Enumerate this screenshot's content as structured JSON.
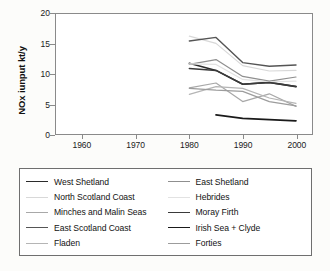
{
  "chart_data": {
    "type": "line",
    "title": "",
    "xlabel": "",
    "ylabel": "NOx iunput kt/y",
    "xlim": [
      1955,
      2003
    ],
    "ylim": [
      0,
      20
    ],
    "xticks": [
      1960,
      1970,
      1980,
      1990,
      2000
    ],
    "yticks": [
      0,
      5,
      10,
      15,
      20
    ],
    "grid": false,
    "legend_position": "below",
    "series": [
      {
        "name": "West Shetland",
        "color": "#2b2b2b",
        "width": 1.6,
        "x": [
          1980,
          1985,
          1990,
          1995,
          2000
        ],
        "values": [
          11.8,
          10.6,
          8.3,
          8.6,
          7.9
        ]
      },
      {
        "name": "East Shetland",
        "color": "#8f8f8f",
        "width": 1.2,
        "x": [
          1980,
          1985,
          1990,
          1995,
          2000
        ],
        "values": [
          11.6,
          12.4,
          9.6,
          8.8,
          9.5
        ]
      },
      {
        "name": "North Scotland Coast",
        "color": "#d8d8d8",
        "width": 1.2,
        "x": [
          1980,
          1985,
          1990,
          1995,
          2000
        ],
        "values": [
          16.3,
          15.1,
          11.4,
          10.5,
          10.6
        ]
      },
      {
        "name": "Hebrides",
        "color": "#e2e2e2",
        "width": 1.2,
        "x": [
          1980,
          1985,
          1990,
          1995,
          2000
        ],
        "values": [
          11.7,
          11.6,
          9.1,
          8.7,
          8.8
        ]
      },
      {
        "name": "Minches and Malin Seas",
        "color": "#a8a8a8",
        "width": 1.2,
        "x": [
          1980,
          1985,
          1990,
          1995,
          2000
        ],
        "values": [
          7.7,
          8.5,
          5.4,
          6.7,
          4.6
        ]
      },
      {
        "name": "Moray Firth",
        "color": "#3a3a3a",
        "width": 1.5,
        "x": [
          1980,
          1985,
          1990,
          1995,
          2000
        ],
        "values": [
          10.9,
          10.6,
          8.3,
          8.6,
          7.9
        ]
      },
      {
        "name": "East Scotland Coast",
        "color": "#555555",
        "width": 1.4,
        "x": [
          1980,
          1985,
          1990,
          1995,
          2000
        ],
        "values": [
          15.5,
          16.1,
          11.9,
          11.3,
          11.5
        ]
      },
      {
        "name": "Irish Sea + Clyde",
        "color": "#1a1a1a",
        "width": 1.7,
        "x": [
          1985,
          1990,
          1995,
          2000
        ],
        "values": [
          3.2,
          2.6,
          2.4,
          2.2
        ]
      },
      {
        "name": "Fladen",
        "color": "#b5b5b5",
        "width": 1.2,
        "x": [
          1980,
          1985,
          1990,
          1995,
          2000
        ],
        "values": [
          6.6,
          7.9,
          7.6,
          6.0,
          5.1
        ]
      },
      {
        "name": "Forties",
        "color": "#9c9c9c",
        "width": 1.2,
        "x": [
          1980,
          1985,
          1990,
          1995,
          2000
        ],
        "values": [
          7.6,
          7.3,
          7.1,
          5.4,
          4.7
        ]
      }
    ]
  },
  "legend": {
    "columns": 2,
    "order": [
      "West Shetland",
      "East Shetland",
      "North Scotland Coast",
      "Hebrides",
      "Minches and Malin Seas",
      "Moray Firth",
      "East Scotland Coast",
      "Irish Sea + Clyde",
      "Fladen",
      "Forties"
    ]
  }
}
